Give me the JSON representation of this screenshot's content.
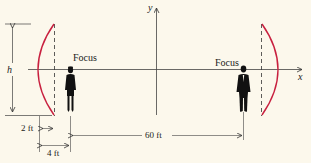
{
  "diagram": {
    "type": "parabolic-dish-whispering-gallery",
    "axes": {
      "x_label": "x",
      "y_label": "y"
    },
    "labels": {
      "focus_left": "Focus",
      "focus_right": "Focus",
      "height": "h",
      "depth": "2 ft",
      "focus_offset": "4 ft",
      "separation": "60 ft"
    },
    "colors": {
      "background": "#fcf8ec",
      "dish": "#c8203f",
      "lines": "#333333",
      "figures": "#111111"
    },
    "elements": {
      "left_dish": {
        "depth_ft": 2,
        "focus_distance_ft": 4
      },
      "right_dish": {
        "depth_ft": 2,
        "focus_distance_ft": 4
      },
      "distance_between_foci_ft": 60,
      "people": [
        "woman-silhouette-at-left-focus",
        "man-silhouette-at-right-focus"
      ]
    }
  }
}
